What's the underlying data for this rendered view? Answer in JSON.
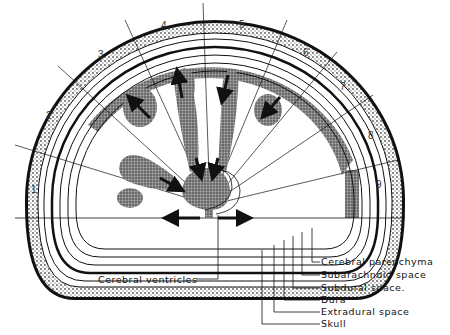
{
  "diagram": {
    "title": "",
    "sector_numbers": [
      "1",
      "2",
      "3",
      "4",
      "5",
      "6",
      "7",
      "8",
      "9"
    ],
    "labels": {
      "cerebral_ventricles": "Cerebral ventricles",
      "cerebral_parenchyma": "Cerebral parenchyma",
      "subarachnoid_space": "Subarachnoid space",
      "subdural_space": "Subdural space.",
      "dura": "Dura",
      "extradural_space": "Extradural space",
      "skull": "Skull"
    },
    "colors": {
      "ink": "#111111",
      "stipple": "#6a6a6a",
      "background": "#ffffff"
    }
  }
}
